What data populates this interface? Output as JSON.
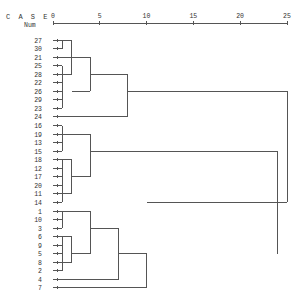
{
  "header": {
    "case_label": "C A S E",
    "num_label": "Num"
  },
  "chart_data": {
    "type": "dendrogram",
    "title": "",
    "xlabel": "Rescaled Distance Cluster Combine",
    "axis_ticks": [
      0,
      5,
      10,
      15,
      20,
      25
    ],
    "xlim": [
      0,
      25
    ],
    "leaf_order": [
      "27",
      "30",
      "21",
      "25",
      "28",
      "22",
      "26",
      "29",
      "23",
      "24",
      "16",
      "19",
      "13",
      "15",
      "18",
      "12",
      "17",
      "20",
      "11",
      "14",
      "1",
      "10",
      "3",
      "6",
      "9",
      "5",
      "8",
      "2",
      "4",
      "7"
    ],
    "merges": [
      {
        "left": [
          "27",
          "30"
        ],
        "distance": 1
      },
      {
        "left": [
          "25",
          "28",
          "22",
          "26",
          "29",
          "23"
        ],
        "distance": 1
      },
      {
        "left": [
          "27-30",
          "25-23"
        ],
        "distance": 2
      },
      {
        "left": [
          "21",
          "27-23"
        ],
        "distance": 4
      },
      {
        "left": [
          "cluster(27..23)",
          "24"
        ],
        "distance": 8
      },
      {
        "left": [
          "16",
          "19",
          "13",
          "15"
        ],
        "distance": 1
      },
      {
        "left": [
          "18",
          "12",
          "17",
          "20",
          "11",
          "14"
        ],
        "distance": 1
      },
      {
        "left": [
          "18..20",
          "11..14"
        ],
        "distance": 2
      },
      {
        "left": [
          "16..15",
          "18..14"
        ],
        "distance": 4
      },
      {
        "left": [
          "1",
          "10",
          "3"
        ],
        "distance": 1
      },
      {
        "left": [
          "6",
          "9",
          "5",
          "8",
          "2"
        ],
        "distance": 1
      },
      {
        "left": [
          "6..9",
          "5..2"
        ],
        "distance": 2
      },
      {
        "left": [
          "1..3",
          "6..2"
        ],
        "distance": 4
      },
      {
        "left": [
          "cluster(1..2)",
          "4"
        ],
        "distance": 7
      },
      {
        "left": [
          "cluster(1..4)",
          "7"
        ],
        "distance": 10
      },
      {
        "left": [
          "cluster(16..14)",
          "cluster(1..7)"
        ],
        "distance": 24
      },
      {
        "left": [
          "cluster(27..24)",
          "cluster(16..7)"
        ],
        "distance": 25
      }
    ]
  },
  "layout": {
    "x0": 53,
    "px_per_unit": 9.36,
    "axis_y": 23,
    "row_y0": 40,
    "row_step": 8.55,
    "label_x": 42,
    "segments": [
      [
        0,
        1,
        1
      ],
      [
        3,
        8,
        1
      ],
      [
        0,
        4,
        2
      ],
      [
        2,
        6,
        4
      ],
      [
        4,
        9,
        8
      ],
      [
        10,
        13,
        1
      ],
      [
        14,
        19,
        1
      ],
      [
        14,
        18,
        2
      ],
      [
        11,
        16,
        4
      ],
      [
        20,
        22,
        1
      ],
      [
        23,
        27,
        1
      ],
      [
        23,
        26,
        2
      ],
      [
        20,
        25,
        4
      ],
      [
        22,
        28,
        7
      ],
      [
        25,
        29,
        10
      ],
      [
        13,
        25,
        24
      ],
      [
        6,
        19,
        25
      ]
    ],
    "horizontals": [
      [
        0,
        0,
        1
      ],
      [
        1,
        0,
        1
      ],
      [
        3,
        0,
        1
      ],
      [
        4,
        0,
        1
      ],
      [
        5,
        0,
        1
      ],
      [
        6,
        0,
        1
      ],
      [
        7,
        0,
        1
      ],
      [
        8,
        0,
        1
      ],
      [
        0,
        1,
        2
      ],
      [
        4,
        1,
        2
      ],
      [
        2,
        0,
        4
      ],
      [
        6,
        2,
        4
      ],
      [
        4,
        4,
        8
      ],
      [
        9,
        0,
        8
      ],
      [
        10,
        0,
        1
      ],
      [
        11,
        0,
        1
      ],
      [
        12,
        0,
        1
      ],
      [
        13,
        0,
        1
      ],
      [
        14,
        0,
        1
      ],
      [
        15,
        0,
        1
      ],
      [
        16,
        0,
        1
      ],
      [
        17,
        0,
        1
      ],
      [
        18,
        0,
        1
      ],
      [
        19,
        0,
        1
      ],
      [
        14,
        1,
        2
      ],
      [
        18,
        1,
        2
      ],
      [
        11,
        1,
        4
      ],
      [
        16,
        2,
        4
      ],
      [
        13,
        4,
        24
      ],
      [
        20,
        0,
        1
      ],
      [
        21,
        0,
        1
      ],
      [
        22,
        0,
        1
      ],
      [
        23,
        0,
        1
      ],
      [
        24,
        0,
        1
      ],
      [
        25,
        0,
        1
      ],
      [
        26,
        0,
        1
      ],
      [
        27,
        0,
        1
      ],
      [
        23,
        1,
        2
      ],
      [
        26,
        1,
        2
      ],
      [
        20,
        1,
        4
      ],
      [
        25,
        2,
        4
      ],
      [
        22,
        4,
        7
      ],
      [
        28,
        0,
        7
      ],
      [
        25,
        7,
        10
      ],
      [
        29,
        0,
        10
      ],
      [
        19,
        10,
        24
      ],
      [
        6,
        8,
        25
      ],
      [
        19,
        24,
        25
      ]
    ]
  }
}
